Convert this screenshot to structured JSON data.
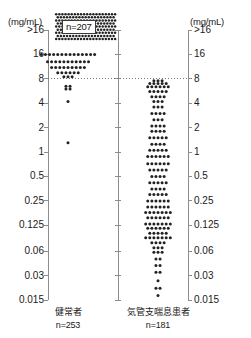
{
  "figure": {
    "type": "dot-plot",
    "background": "#ffffff",
    "dot_color": "#222222",
    "axis_color": "#8c8c8c",
    "text_color": "#1a1a1a"
  },
  "axes": {
    "unit_left": "(mg/mL)",
    "unit_right": "(mg/mL)",
    "tick_labels": [
      ">16",
      "16",
      "8",
      "4",
      "2",
      "1",
      "0.5",
      "0.25",
      "0.125",
      "0.06",
      "0.03",
      "0.015"
    ],
    "tick_values": [
      32,
      16,
      8,
      4,
      2,
      1,
      0.5,
      0.25,
      0.125,
      0.06,
      0.03,
      0.015
    ],
    "reference_line_label": "8",
    "reference_line_value": 8
  },
  "annotations": {
    "overflow_count": "n=207"
  },
  "groups": [
    {
      "name": "健常者",
      "n_label": "n=253",
      "n": 253,
      "overflow_label": "n=207",
      "overflow_n": 207
    },
    {
      "name": "気管支喘息患者",
      "n_label": "n=181",
      "n": 181,
      "overflow_label": "",
      "overflow_n": 0
    }
  ],
  "chart_data": {
    "type": "scatter",
    "title": "",
    "xlabel": "",
    "ylabel": "(mg/mL)",
    "yscale": "log",
    "ylim": [
      0.015,
      32
    ],
    "grid": false,
    "reference_lines": [
      {
        "y": 8,
        "style": "dotted",
        "label": "8"
      }
    ],
    "ytick_labels": [
      ">16",
      "16",
      "8",
      "4",
      "2",
      "1",
      "0.5",
      "0.25",
      "0.125",
      "0.06",
      "0.03",
      "0.015"
    ],
    "ytick_values": [
      32,
      16,
      8,
      4,
      2,
      1,
      0.5,
      0.25,
      0.125,
      0.06,
      0.03,
      0.015
    ],
    "categories": [
      "健常者",
      "気管支喘息患者"
    ],
    "series": [
      {
        "name": "健常者",
        "n": 253,
        "overflow_at_top": 207,
        "overflow_label": "n=207",
        "bins": [
          {
            "value": 32,
            "count": 207
          },
          {
            "value": 16,
            "count": 14
          },
          {
            "value": 13,
            "count": 11
          },
          {
            "value": 11,
            "count": 9
          },
          {
            "value": 9.5,
            "count": 6
          },
          {
            "value": 8.5,
            "count": 3
          },
          {
            "value": 6.5,
            "count": 2
          },
          {
            "value": 6.0,
            "count": 2
          },
          {
            "value": 4.2,
            "count": 1
          },
          {
            "value": 1.3,
            "count": 1
          }
        ]
      },
      {
        "name": "気管支喘息患者",
        "n": 181,
        "overflow_at_top": 0,
        "overflow_label": "",
        "bins": [
          {
            "value": 7.6,
            "count": 3
          },
          {
            "value": 7.0,
            "count": 5
          },
          {
            "value": 6.4,
            "count": 6
          },
          {
            "value": 5.6,
            "count": 5
          },
          {
            "value": 4.8,
            "count": 4
          },
          {
            "value": 4.2,
            "count": 3
          },
          {
            "value": 3.6,
            "count": 3
          },
          {
            "value": 3.0,
            "count": 4
          },
          {
            "value": 2.5,
            "count": 3
          },
          {
            "value": 2.1,
            "count": 4
          },
          {
            "value": 1.8,
            "count": 4
          },
          {
            "value": 1.5,
            "count": 5
          },
          {
            "value": 1.25,
            "count": 4
          },
          {
            "value": 1.05,
            "count": 5
          },
          {
            "value": 0.88,
            "count": 6
          },
          {
            "value": 0.72,
            "count": 6
          },
          {
            "value": 0.6,
            "count": 5
          },
          {
            "value": 0.5,
            "count": 4
          },
          {
            "value": 0.42,
            "count": 5
          },
          {
            "value": 0.35,
            "count": 4
          },
          {
            "value": 0.3,
            "count": 5
          },
          {
            "value": 0.25,
            "count": 6
          },
          {
            "value": 0.21,
            "count": 6
          },
          {
            "value": 0.18,
            "count": 7
          },
          {
            "value": 0.155,
            "count": 6
          },
          {
            "value": 0.13,
            "count": 7
          },
          {
            "value": 0.115,
            "count": 6
          },
          {
            "value": 0.1,
            "count": 5
          },
          {
            "value": 0.088,
            "count": 7
          },
          {
            "value": 0.076,
            "count": 4
          },
          {
            "value": 0.066,
            "count": 3
          },
          {
            "value": 0.058,
            "count": 3
          },
          {
            "value": 0.048,
            "count": 2
          },
          {
            "value": 0.04,
            "count": 2
          },
          {
            "value": 0.033,
            "count": 2
          },
          {
            "value": 0.026,
            "count": 1
          },
          {
            "value": 0.021,
            "count": 2
          },
          {
            "value": 0.017,
            "count": 1
          }
        ]
      }
    ]
  },
  "layout": {
    "axis_left_x": 48,
    "axis_mid_x": 118,
    "axis_right_x": 188,
    "axis_top_y": 30,
    "axis_bottom_y": 300,
    "tick_label_left_x": 2,
    "tick_label_right_x": 194,
    "group_centers": [
      68,
      158
    ],
    "dense_block": {
      "x": 55,
      "y": 13,
      "w": 62,
      "h": 25
    }
  }
}
